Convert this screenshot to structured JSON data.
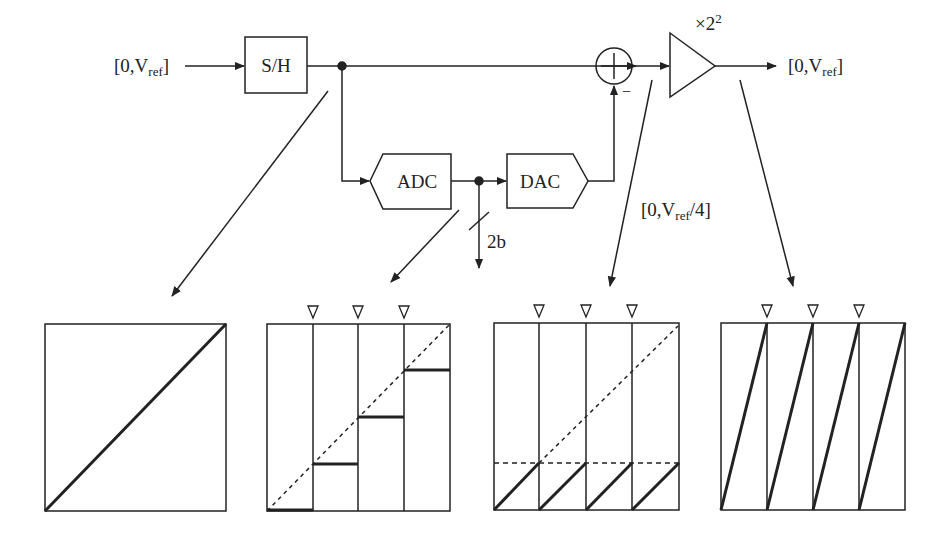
{
  "diagram": {
    "input_label": {
      "prefix": "[0,V",
      "sub": "ref",
      "suffix": "]"
    },
    "output_label": {
      "prefix": "[0,V",
      "sub": "ref",
      "suffix": "]"
    },
    "residue_label": {
      "prefix": "[0,V",
      "sub": "ref",
      "suffix": "/4]"
    },
    "blocks": {
      "sh": "S/H",
      "adc": "ADC",
      "dac": "DAC",
      "summer_sign": "−",
      "gain": {
        "prefix": "×2",
        "sup": "2"
      }
    },
    "bus_width": "2b",
    "panels": [
      {
        "name": "sample-hold-transfer",
        "description": "Linear ramp 0 to Vref"
      },
      {
        "name": "adc-dac-transfer",
        "description": "4-level staircase with dashed ideal line",
        "markers": 3
      },
      {
        "name": "residue-transfer",
        "description": "Sawtooth residue limited to Vref/4 (dashed level)",
        "markers": 3
      },
      {
        "name": "amplified-residue-transfer",
        "description": "Sawtooth amplified to full scale",
        "markers": 3
      }
    ]
  },
  "colors": {
    "stroke": "#222222",
    "background": "#ffffff"
  }
}
